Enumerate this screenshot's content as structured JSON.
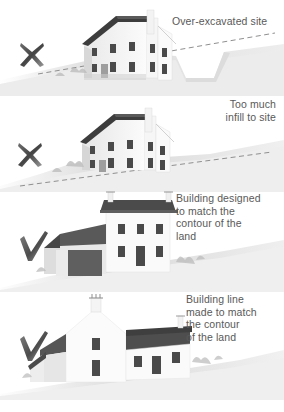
{
  "figure": {
    "palette": {
      "background": "#ffffff",
      "text": "#595959",
      "mark_dark": "#4a4a4a",
      "mark_light": "#b6b6b6",
      "roof_dark": "#3c3c3c",
      "roof_mid": "#585858",
      "wall_light": "#f2f2f2",
      "wall_shade": "#cfcfcf",
      "window_dark": "#4a4a4a",
      "ground_light": "#e3e3e3",
      "ground_mid": "#c9c9c9",
      "ground_dark": "#a8a8a8",
      "dashed_line": "#8d8d8d"
    },
    "panels": [
      {
        "id": "panel-1",
        "caption": "Over-excavated site",
        "caption_align": "left",
        "mark": "cross",
        "mark_label": "incorrect-cross-mark",
        "house": "tall-two-storey-house-on-cut-slope",
        "ground": "hillside-with-excavated-notch",
        "has_dashed_contour": true,
        "dashed_contour_label": "original-ground-contour"
      },
      {
        "id": "panel-2",
        "caption": "Too much\ninfill to site",
        "caption_align": "right",
        "mark": "cross",
        "mark_label": "incorrect-cross-mark",
        "house": "tall-two-storey-house-on-raised-platform",
        "ground": "hillside-with-infill-mound",
        "has_dashed_contour": true,
        "dashed_contour_label": "original-ground-contour"
      },
      {
        "id": "panel-3",
        "caption": "Building designed\nto match the\ncontour of the\nland",
        "caption_align": "left",
        "mark": "tick",
        "mark_label": "correct-tick-mark",
        "house": "stepped-house-with-lower-garage-wing",
        "ground": "natural-sloping-hillside",
        "has_dashed_contour": false
      },
      {
        "id": "panel-4",
        "caption": "Building line\nmade to match\nthe contour\nof the land",
        "caption_align": "left",
        "mark": "tick",
        "mark_label": "correct-tick-mark",
        "house": "long-low-house-following-slope",
        "ground": "natural-sloping-hillside",
        "has_dashed_contour": false
      }
    ],
    "bottom_partial_text": ""
  }
}
